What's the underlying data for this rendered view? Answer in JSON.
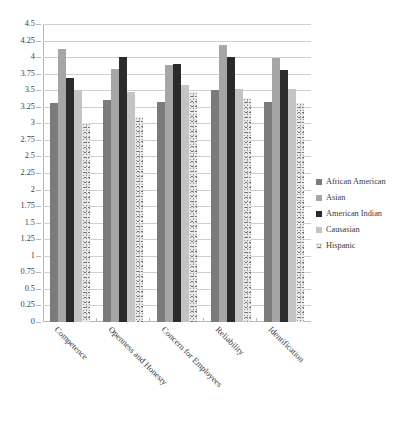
{
  "chart_data": {
    "type": "bar",
    "title": "",
    "xlabel": "",
    "ylabel": "",
    "ylim": [
      0,
      4.5
    ],
    "ytick_step": 0.25,
    "yticks": [
      "0",
      "0.25",
      "0.5",
      "0.75",
      "1",
      "1.25",
      "1.5",
      "1.75",
      "2",
      "2.25",
      "2.5",
      "2.75",
      "3",
      "3.25",
      "3.5",
      "3.75",
      "4",
      "4.25",
      "4.5"
    ],
    "grid": true,
    "legend_position": "right",
    "categories": [
      "Competence",
      "Openness and Honesty",
      "Concern for Employees",
      "Reliability",
      "Identification"
    ],
    "series": [
      {
        "name": "African American",
        "color": "#7b7b7b",
        "fill": "solid",
        "values": [
          3.3,
          3.35,
          3.32,
          3.5,
          3.32
        ]
      },
      {
        "name": "Asian",
        "color": "#a6a6a6",
        "fill": "solid",
        "values": [
          4.12,
          3.82,
          3.88,
          4.18,
          3.98
        ]
      },
      {
        "name": "American Indian",
        "color": "#2b2b2b",
        "fill": "solid",
        "values": [
          3.68,
          4.0,
          3.9,
          4.0,
          3.8
        ]
      },
      {
        "name": "Causasian",
        "color": "#c4c4c4",
        "fill": "solid",
        "values": [
          3.5,
          3.48,
          3.58,
          3.52,
          3.52
        ]
      },
      {
        "name": "Hispanic",
        "color": "#e9e9e9",
        "fill": "speckled",
        "values": [
          3.0,
          3.1,
          3.48,
          3.38,
          3.3
        ]
      }
    ]
  }
}
